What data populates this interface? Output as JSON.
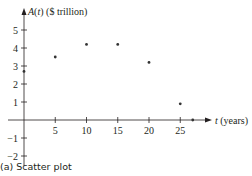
{
  "caption": "(a) Scatter plot",
  "chart_data": {
    "type": "scatter",
    "title": "",
    "xlabel": "t (years)",
    "ylabel": "A(t) ($ trillion)",
    "x_ticks": [
      5,
      10,
      15,
      20,
      25
    ],
    "y_ticks": [
      -2,
      -1,
      1,
      2,
      3,
      4,
      5
    ],
    "x_tick_labels": [
      "5",
      "10",
      "15",
      "20",
      "25"
    ],
    "y_tick_labels": [
      "−2",
      "−1",
      "1",
      "2",
      "3",
      "4",
      "5"
    ],
    "xlim": [
      0,
      28
    ],
    "ylim": [
      -2,
      5.5
    ],
    "grid": false,
    "legend": null,
    "series": [
      {
        "name": "A(t)",
        "x": [
          0,
          5,
          10,
          15,
          20,
          25,
          27
        ],
        "y": [
          2.7,
          3.5,
          4.2,
          4.2,
          3.2,
          0.9,
          0
        ]
      }
    ],
    "colors": {
      "ink": "#231f20",
      "point": "#333333"
    }
  }
}
